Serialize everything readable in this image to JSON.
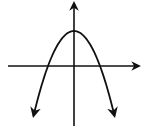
{
  "chart_data": {
    "type": "line",
    "title": "",
    "xlabel": "",
    "ylabel": "",
    "grid": false,
    "legend": null,
    "function": "y = -x^2 + 4",
    "xlim": [
      -3,
      3
    ],
    "ylim": [
      -5.5,
      6
    ],
    "series": [
      {
        "name": "parabola",
        "x": [
          -3,
          -2.5,
          -2,
          -1.5,
          -1,
          -0.5,
          0,
          0.5,
          1,
          1.5,
          2,
          2.5,
          3
        ],
        "y": [
          -5,
          -2.25,
          0,
          1.75,
          3,
          3.75,
          4,
          3.75,
          3,
          1.75,
          0,
          -2.25,
          -5
        ]
      }
    ],
    "key_points": {
      "vertex": [
        0,
        4
      ],
      "x_intercepts": [
        -2,
        2
      ],
      "y_intercept": 4
    },
    "colors": {
      "stroke": "#111111",
      "background": "#ffffff"
    }
  }
}
